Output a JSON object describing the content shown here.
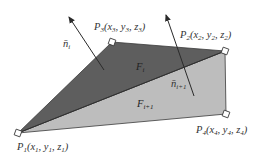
{
  "diagram": {
    "colors": {
      "background": "#ffffff",
      "face_i": "#5e5e5e",
      "face_i_plus_1": "#bdbdbd",
      "edge": "#3a3a3a",
      "vertex_marker": "#ffffff",
      "arrow": "#2a2a2a",
      "text": "#333333"
    },
    "vertices": [
      {
        "id": "P1",
        "label": "P",
        "sub": "1",
        "coords": "(x₁, y₁, z₁)",
        "x": 18,
        "y": 133
      },
      {
        "id": "P2",
        "label": "P",
        "sub": "2",
        "coords": "(x₂, y₂, z₂)",
        "x": 225,
        "y": 51
      },
      {
        "id": "P3",
        "label": "P",
        "sub": "3",
        "coords": "(x₃, y₃, z₃)",
        "x": 112,
        "y": 42
      },
      {
        "id": "P4",
        "label": "P",
        "sub": "4",
        "coords": "(x₄, y₄, z₄)",
        "x": 226,
        "y": 114
      }
    ],
    "labels": {
      "p1": {
        "main": "P",
        "sub": "1",
        "rest": "(x",
        "s1": "1",
        "c1": ", y",
        "s2": "1",
        "c2": ", z",
        "s3": "1",
        "end": ")"
      },
      "p2": {
        "main": "P",
        "sub": "2",
        "rest": "(x",
        "s1": "2",
        "c1": ", y",
        "s2": "2",
        "c2": ", z",
        "s3": "2",
        "end": ")"
      },
      "p3": {
        "main": "P",
        "sub": "3",
        "rest": "(x",
        "s1": "3",
        "c1": ", y",
        "s2": "3",
        "c2": ", z",
        "s3": "3",
        "end": ")"
      },
      "p4": {
        "main": "P",
        "sub": "4",
        "rest": "(x",
        "s1": "4",
        "c1": ", y",
        "s2": "4",
        "c2": ", z",
        "s3": "4",
        "end": ")"
      }
    },
    "faces": [
      {
        "id": "F_i",
        "main": "F",
        "sub": "i",
        "vertices": [
          "P1",
          "P3",
          "P2"
        ]
      },
      {
        "id": "F_i+1",
        "main": "F",
        "sub": "i+1",
        "vertices": [
          "P1",
          "P2",
          "P4"
        ]
      }
    ],
    "normals": [
      {
        "id": "n_i",
        "main": "n̄",
        "sub": "i",
        "from": [
          104,
          70
        ],
        "to": [
          69,
          17
        ]
      },
      {
        "id": "n_i+1",
        "main": "n̄",
        "sub": "i+1",
        "from": [
          194,
          96
        ],
        "to": [
          166,
          15
        ]
      }
    ]
  }
}
